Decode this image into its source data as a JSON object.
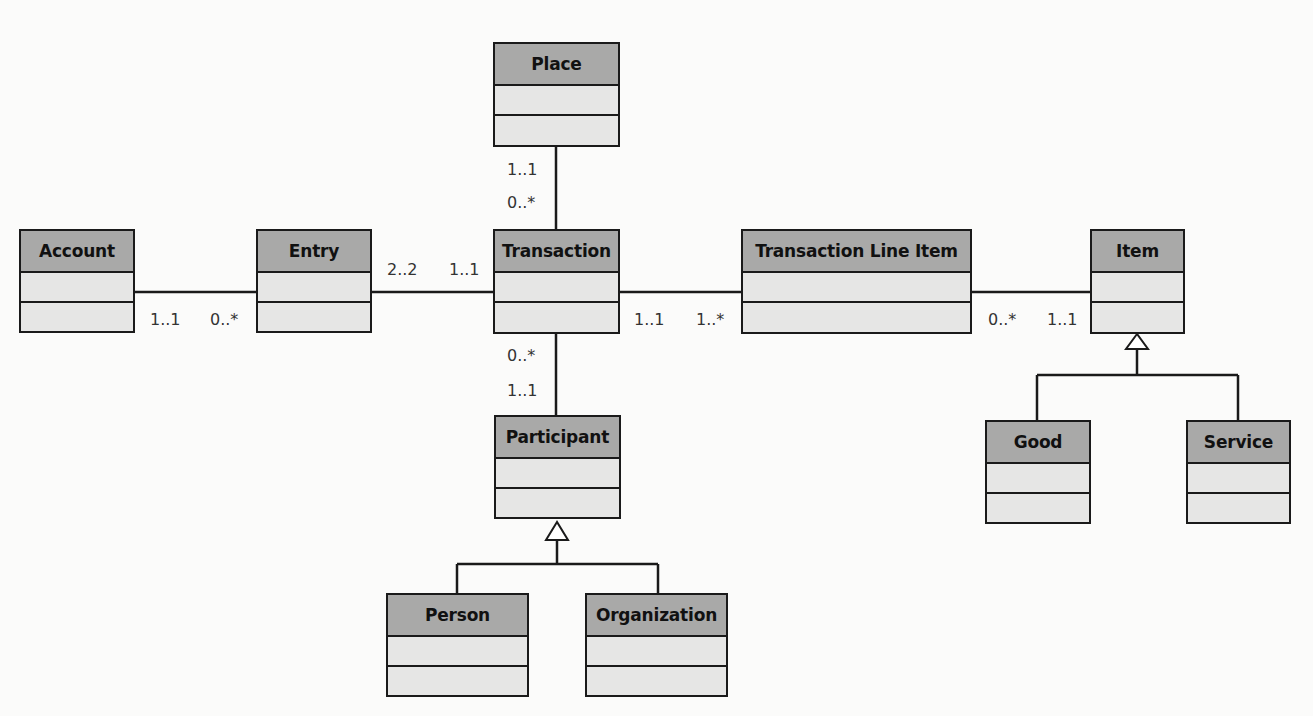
{
  "diagram": {
    "type": "uml-class-diagram",
    "classes": {
      "account": {
        "name": "Account"
      },
      "entry": {
        "name": "Entry"
      },
      "place": {
        "name": "Place"
      },
      "transaction": {
        "name": "Transaction"
      },
      "transaction_line_item": {
        "name": "Transaction Line Item"
      },
      "item": {
        "name": "Item"
      },
      "participant": {
        "name": "Participant"
      },
      "person": {
        "name": "Person"
      },
      "organization": {
        "name": "Organization"
      },
      "good": {
        "name": "Good"
      },
      "service": {
        "name": "Service"
      }
    },
    "associations": [
      {
        "from": "Account",
        "to": "Entry",
        "from_mult": "1..1",
        "to_mult": "0..*"
      },
      {
        "from": "Entry",
        "to": "Transaction",
        "from_mult": "2..2",
        "to_mult": "1..1"
      },
      {
        "from": "Place",
        "to": "Transaction",
        "from_mult": "1..1",
        "to_mult": "0..*"
      },
      {
        "from": "Transaction",
        "to": "Transaction Line Item",
        "from_mult": "1..1",
        "to_mult": "1..*"
      },
      {
        "from": "Transaction Line Item",
        "to": "Item",
        "from_mult": "0..*",
        "to_mult": "1..1"
      },
      {
        "from": "Transaction",
        "to": "Participant",
        "from_mult": "0..*",
        "to_mult": "1..1"
      }
    ],
    "generalizations": [
      {
        "parent": "Participant",
        "children": [
          "Person",
          "Organization"
        ]
      },
      {
        "parent": "Item",
        "children": [
          "Good",
          "Service"
        ]
      }
    ],
    "multiplicities": {
      "account_entry_left": "1..1",
      "account_entry_right": "0..*",
      "entry_txn_left": "2..2",
      "entry_txn_right": "1..1",
      "place_txn_top": "1..1",
      "place_txn_bottom": "0..*",
      "txn_tli_left": "1..1",
      "txn_tli_right": "1..*",
      "tli_item_left": "0..*",
      "tli_item_right": "1..1",
      "txn_participant_top": "0..*",
      "txn_participant_bottom": "1..1"
    },
    "colors": {
      "header_fill": "#a9a9a8",
      "compartment_fill": "#e6e6e5",
      "line": "#1a1a1a",
      "background": "#fbfbfa"
    }
  }
}
